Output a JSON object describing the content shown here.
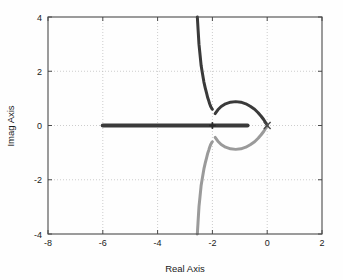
{
  "chart_data": {
    "type": "line",
    "title": "",
    "xlabel": "Real Axis",
    "ylabel": "Imag Axis",
    "xlim": [
      -8,
      2
    ],
    "ylim": [
      -4,
      4
    ],
    "xticks": [
      -8,
      -6,
      -4,
      -2,
      0,
      2
    ],
    "xtick_labels": [
      "-8",
      "-6",
      "-4",
      "-2",
      "0",
      "2"
    ],
    "yticks": [
      -4,
      -2,
      0,
      2,
      4
    ],
    "ytick_labels": [
      "-4",
      "-2",
      "0",
      "2",
      "4"
    ],
    "grid": true,
    "grid_style": "dotted",
    "legend": "none",
    "colors": {
      "branch_upper": "#3a3a3a",
      "branch_lower": "#9a9a9a",
      "axis": "#4a4a4a",
      "grid": "#b8b8b8",
      "text": "#1a1a1a",
      "background": "#fefefe"
    },
    "markers": [
      {
        "name": "breakaway-cross",
        "symbol": "+",
        "x": -2.0,
        "y": 0.0,
        "color": "#2a2a2a"
      },
      {
        "name": "open-loop-pole-origin",
        "symbol": "x",
        "x": 0.0,
        "y": 0.0,
        "color": "#4a4a4a"
      }
    ],
    "series": [
      {
        "name": "real-axis-branch-left",
        "color": "#3a3a3a",
        "points": [
          [
            -6.0,
            0.0
          ],
          [
            -5.5,
            0.0
          ],
          [
            -5.0,
            0.0
          ],
          [
            -4.5,
            0.0
          ],
          [
            -4.0,
            0.0
          ],
          [
            -3.5,
            0.0
          ],
          [
            -3.0,
            0.0
          ],
          [
            -2.7,
            0.0
          ],
          [
            -2.45,
            0.0
          ],
          [
            -2.25,
            0.0
          ],
          [
            -2.1,
            0.0
          ],
          [
            -2.0,
            0.0
          ]
        ]
      },
      {
        "name": "real-axis-branch-right",
        "color": "#3a3a3a",
        "points": [
          [
            -2.0,
            0.0
          ],
          [
            -1.9,
            0.0
          ],
          [
            -1.75,
            0.0
          ],
          [
            -1.55,
            0.0
          ],
          [
            -1.35,
            0.0
          ],
          [
            -1.15,
            0.0
          ],
          [
            -0.95,
            0.0
          ],
          [
            -0.8,
            0.0
          ],
          [
            -0.72,
            0.0
          ]
        ]
      },
      {
        "name": "asymptotic-branch-upper",
        "color": "#3a3a3a",
        "points": [
          [
            -2.55,
            4.0
          ],
          [
            -2.52,
            3.5
          ],
          [
            -2.49,
            3.0
          ],
          [
            -2.45,
            2.6
          ],
          [
            -2.41,
            2.2
          ],
          [
            -2.36,
            1.9
          ],
          [
            -2.31,
            1.6
          ],
          [
            -2.26,
            1.38
          ],
          [
            -2.21,
            1.18
          ],
          [
            -2.17,
            1.02
          ],
          [
            -2.13,
            0.9
          ],
          [
            -2.1,
            0.8
          ],
          [
            -2.07,
            0.72
          ],
          [
            -2.04,
            0.66
          ],
          [
            -2.02,
            0.62
          ],
          [
            -2.0,
            0.6
          ]
        ]
      },
      {
        "name": "asymptotic-branch-lower",
        "color": "#9a9a9a",
        "points": [
          [
            -2.55,
            -4.0
          ],
          [
            -2.52,
            -3.5
          ],
          [
            -2.49,
            -3.0
          ],
          [
            -2.45,
            -2.6
          ],
          [
            -2.41,
            -2.2
          ],
          [
            -2.36,
            -1.9
          ],
          [
            -2.31,
            -1.6
          ],
          [
            -2.26,
            -1.38
          ],
          [
            -2.21,
            -1.18
          ],
          [
            -2.17,
            -1.02
          ],
          [
            -2.13,
            -0.9
          ],
          [
            -2.1,
            -0.8
          ],
          [
            -2.07,
            -0.72
          ],
          [
            -2.04,
            -0.66
          ],
          [
            -2.02,
            -0.62
          ],
          [
            -2.0,
            -0.6
          ]
        ]
      },
      {
        "name": "circular-loop-upper",
        "color": "#3a3a3a",
        "points": [
          [
            -1.9,
            0.44
          ],
          [
            -1.8,
            0.58
          ],
          [
            -1.68,
            0.7
          ],
          [
            -1.52,
            0.8
          ],
          [
            -1.34,
            0.86
          ],
          [
            -1.15,
            0.88
          ],
          [
            -0.96,
            0.86
          ],
          [
            -0.78,
            0.8
          ],
          [
            -0.62,
            0.71
          ],
          [
            -0.46,
            0.6
          ],
          [
            -0.33,
            0.47
          ],
          [
            -0.22,
            0.34
          ],
          [
            -0.13,
            0.22
          ],
          [
            -0.06,
            0.11
          ],
          [
            -0.01,
            0.03
          ],
          [
            0.0,
            0.0
          ]
        ]
      },
      {
        "name": "circular-loop-lower",
        "color": "#9a9a9a",
        "points": [
          [
            -1.9,
            -0.44
          ],
          [
            -1.8,
            -0.58
          ],
          [
            -1.68,
            -0.7
          ],
          [
            -1.52,
            -0.8
          ],
          [
            -1.34,
            -0.86
          ],
          [
            -1.15,
            -0.88
          ],
          [
            -0.96,
            -0.86
          ],
          [
            -0.78,
            -0.8
          ],
          [
            -0.62,
            -0.71
          ],
          [
            -0.46,
            -0.6
          ],
          [
            -0.33,
            -0.47
          ],
          [
            -0.22,
            -0.34
          ],
          [
            -0.13,
            -0.22
          ],
          [
            -0.06,
            -0.11
          ],
          [
            -0.01,
            -0.03
          ],
          [
            0.0,
            0.0
          ]
        ]
      }
    ]
  },
  "axes": {
    "x_title": "Real Axis",
    "y_title": "Imag Axis"
  }
}
